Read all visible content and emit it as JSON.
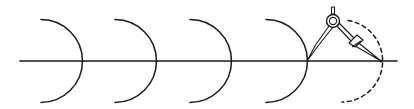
{
  "diagram": {
    "title": "",
    "stroke_color": "#1a1a1a",
    "background": "#ffffff",
    "baseline": {
      "x1": 20,
      "y1": 61,
      "x2": 397,
      "y2": 61
    },
    "arcs": [
      {
        "cx": 40,
        "cy": 61,
        "r": 41,
        "style": "solid"
      },
      {
        "cx": 114,
        "cy": 61,
        "r": 41,
        "style": "solid"
      },
      {
        "cx": 189,
        "cy": 61,
        "r": 41,
        "style": "solid"
      },
      {
        "cx": 266,
        "cy": 61,
        "r": 41,
        "style": "solid"
      },
      {
        "cx": 340,
        "cy": 61,
        "r": 41,
        "style": "dashed"
      }
    ],
    "compass": {
      "hinge": {
        "cx": 333,
        "cy": 21,
        "r": 6
      },
      "needle_point": {
        "x": 307,
        "y": 61
      },
      "pencil_point": {
        "x": 381,
        "y": 61
      }
    }
  }
}
